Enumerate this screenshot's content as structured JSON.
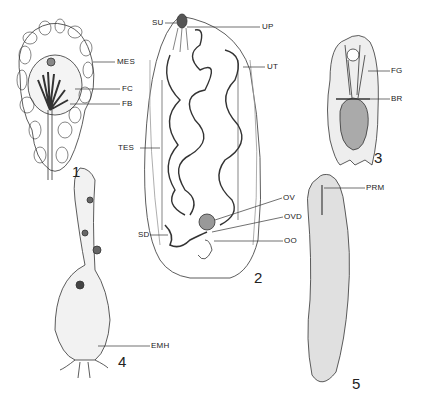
{
  "figure": {
    "panels": [
      {
        "number": "1",
        "labels": [
          "MES",
          "FC",
          "FB"
        ]
      },
      {
        "number": "2",
        "labels": [
          "SU",
          "UP",
          "UT",
          "TES",
          "OV",
          "OVD",
          "SD",
          "OO"
        ]
      },
      {
        "number": "3",
        "labels": [
          "FG",
          "BR"
        ]
      },
      {
        "number": "4",
        "labels": [
          "EMH"
        ]
      },
      {
        "number": "5",
        "labels": [
          "PRM"
        ]
      }
    ]
  },
  "labels": {
    "mes": "MES",
    "fc": "FC",
    "fb": "FB",
    "su": "SU",
    "up": "UP",
    "ut": "UT",
    "tes": "TES",
    "ov": "OV",
    "ovd": "OVD",
    "sd": "SD",
    "oo": "OO",
    "fg": "FG",
    "br": "BR",
    "emh": "EMH",
    "prm": "PRM"
  },
  "numbers": {
    "p1": "1",
    "p2": "2",
    "p3": "3",
    "p4": "4",
    "p5": "5"
  }
}
